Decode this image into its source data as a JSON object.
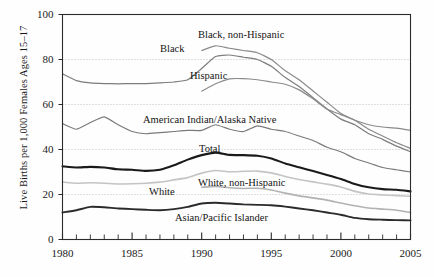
{
  "chart_data": {
    "type": "line",
    "title": "",
    "subtitle": "",
    "xlabel": "",
    "ylabel": "Live Births per 1,000 Females Ages 15–17",
    "xlim": [
      1980,
      2005
    ],
    "ylim": [
      0,
      100
    ],
    "grid": true,
    "grid_style": "dotted horizontal gridlines at 20, 40, 60, 80",
    "legend_position": "inline labels on plot",
    "x_tick_labels": [
      "1980",
      "1985",
      "1990",
      "1995",
      "2000",
      "2005"
    ],
    "x_tick_values": [
      1980,
      1985,
      1990,
      1995,
      2000,
      2005
    ],
    "x_minor_ticks_every": 1,
    "y_tick_labels": [
      "0",
      "20",
      "40",
      "60",
      "80",
      "100"
    ],
    "y_tick_values": [
      0,
      20,
      40,
      60,
      80,
      100
    ],
    "x": [
      1980,
      1981,
      1982,
      1983,
      1984,
      1985,
      1986,
      1987,
      1988,
      1989,
      1990,
      1991,
      1992,
      1993,
      1994,
      1995,
      1996,
      1997,
      1998,
      1999,
      2000,
      2001,
      2002,
      2003,
      2004,
      2005
    ],
    "series": [
      {
        "name": "Black",
        "label": "Black",
        "color": "#7d7d7d",
        "width": 1.2,
        "values": [
          73.6,
          70.6,
          69.6,
          69.3,
          69.2,
          69.3,
          69.3,
          69.6,
          70.0,
          71.0,
          76.0,
          81.3,
          82.0,
          81.0,
          80.0,
          77.0,
          72.0,
          68.0,
          63.0,
          58.0,
          53.5,
          51.0,
          47.0,
          44.5,
          41.5,
          39.0
        ]
      },
      {
        "name": "Black, non-Hispanic",
        "label": "Black, non-Hispanic",
        "color": "#8a8a8a",
        "width": 1.2,
        "values": [
          null,
          null,
          null,
          null,
          null,
          null,
          null,
          null,
          null,
          null,
          84.0,
          86.1,
          85.0,
          84.0,
          83.0,
          80.0,
          75.0,
          71.0,
          66.0,
          61.0,
          56.0,
          53.0,
          49.0,
          46.0,
          43.0,
          40.5
        ]
      },
      {
        "name": "Hispanic",
        "label": "Hispanic",
        "color": "#8a8a8a",
        "width": 1.2,
        "values": [
          null,
          null,
          null,
          null,
          null,
          null,
          null,
          null,
          null,
          null,
          65.9,
          69.2,
          71.4,
          71.5,
          71.0,
          70.0,
          69.0,
          66.5,
          62.5,
          58.0,
          55.5,
          53.0,
          51.0,
          50.0,
          49.5,
          48.5
        ]
      },
      {
        "name": "American Indian/Alaska Native",
        "label": "American Indian/Alaska Native",
        "color": "#7a7a7a",
        "width": 1.2,
        "values": [
          51.5,
          49.0,
          52.0,
          54.5,
          51.0,
          48.0,
          47.0,
          47.5,
          48.0,
          48.5,
          48.5,
          51.0,
          49.0,
          48.0,
          50.5,
          49.0,
          48.0,
          46.0,
          44.0,
          41.0,
          39.0,
          36.0,
          34.0,
          32.0,
          31.0,
          30.0
        ]
      },
      {
        "name": "Total",
        "label": "Total",
        "color": "#1a1a1a",
        "width": 2.1,
        "values": [
          32.5,
          32.0,
          32.3,
          32.0,
          31.2,
          31.0,
          30.5,
          31.0,
          33.0,
          35.5,
          37.5,
          38.6,
          37.6,
          37.5,
          37.2,
          36.0,
          33.8,
          32.1,
          30.4,
          28.7,
          26.9,
          24.7,
          23.2,
          22.4,
          22.1,
          21.4
        ]
      },
      {
        "name": "White, non-Hispanic",
        "label": "White, non-Hispanic",
        "color": "#b2b2b2",
        "width": 1.6,
        "values": [
          null,
          null,
          null,
          null,
          null,
          null,
          null,
          null,
          null,
          null,
          23.2,
          23.6,
          23.0,
          22.7,
          22.8,
          22.0,
          20.6,
          19.4,
          18.5,
          17.5,
          16.2,
          15.0,
          14.0,
          13.5,
          13.0,
          12.0
        ]
      },
      {
        "name": "White",
        "label": "White",
        "color": "#c4c4c4",
        "width": 1.6,
        "values": [
          25.5,
          25.0,
          25.2,
          25.0,
          24.7,
          24.8,
          25.0,
          25.5,
          26.5,
          27.5,
          29.5,
          30.7,
          30.1,
          30.3,
          30.4,
          29.6,
          28.0,
          26.7,
          25.6,
          24.6,
          23.3,
          21.4,
          20.2,
          19.8,
          19.5,
          19.2
        ]
      },
      {
        "name": "Asian/Pacific Islander",
        "label": "Asian/Pacific Islander",
        "color": "#2b2b2b",
        "width": 1.9,
        "values": [
          12.0,
          13.0,
          14.5,
          14.3,
          13.8,
          13.5,
          13.2,
          13.0,
          13.5,
          14.5,
          16.0,
          16.3,
          16.0,
          15.6,
          15.4,
          15.2,
          14.6,
          13.8,
          13.0,
          12.0,
          11.0,
          9.6,
          9.0,
          8.8,
          8.6,
          8.5
        ]
      }
    ],
    "annotations": [
      {
        "text": "Black",
        "x_px": 160,
        "y_px": 43
      },
      {
        "text": "Black, non-Hispanic",
        "x_px": 198,
        "y_px": 29
      },
      {
        "text": "Hispanic",
        "x_px": 190,
        "y_px": 70
      },
      {
        "text": "American Indian/Alaska Native",
        "x_px": 143,
        "y_px": 114
      },
      {
        "text": "Total",
        "x_px": 199,
        "y_px": 143
      },
      {
        "text": "White",
        "x_px": 149,
        "y_px": 186
      },
      {
        "text": "White, non-Hispanic",
        "x_px": 198,
        "y_px": 177
      },
      {
        "text": "Asian/Pacific Islander",
        "x_px": 175,
        "y_px": 212
      }
    ]
  },
  "axis": {
    "y_title": "Live Births per 1,000 Females Ages 15–17",
    "y_ticks": [
      "100",
      "80",
      "60",
      "40",
      "20",
      "0"
    ],
    "x_ticks": [
      "1980",
      "1985",
      "1990",
      "1995",
      "2000",
      "2005"
    ]
  },
  "colors": {
    "background": "#fefefe",
    "frame": "#2a2a2a",
    "gridline": "#b9b9b9",
    "text": "#1a1a1a"
  }
}
